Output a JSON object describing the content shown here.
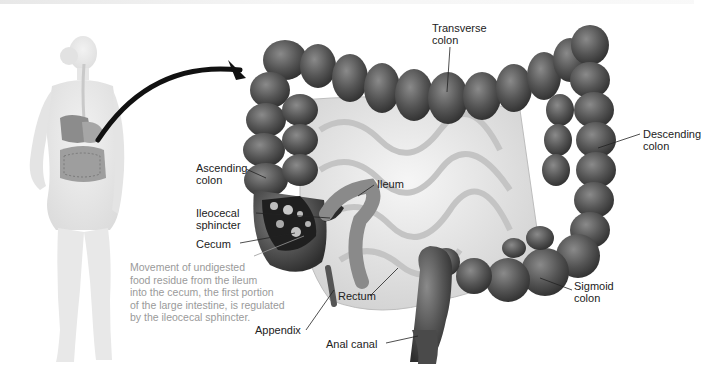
{
  "figure": {
    "colors": {
      "colon_dark": "#3d3d3d",
      "colon_mid": "#6b6b6b",
      "colon_light": "#9a9a9a",
      "small_intestine": "#e6e6e6",
      "body_silhouette": "#ececec",
      "arrow": "#111111",
      "label_text": "#222222",
      "note_text": "#9a9a9a"
    },
    "labels": {
      "transverse_colon": "Transverse\ncolon",
      "descending_colon": "Descending\ncolon",
      "ascending_colon": "Ascending\ncolon",
      "ileum": "Ileum",
      "ileocecal_sphincter": "Ileocecal\nsphincter",
      "cecum": "Cecum",
      "rectum": "Rectum",
      "sigmoid_colon": "Sigmoid\ncolon",
      "appendix": "Appendix",
      "anal_canal": "Anal canal"
    },
    "note": "Movement of undigested\nfood residue from the ileum\ninto the cecum, the first portion\nof the large intestine, is regulated\nby the ileocecal sphincter."
  }
}
